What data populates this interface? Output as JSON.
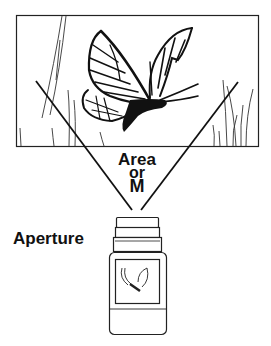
{
  "diagram": {
    "labels": {
      "area": "Area",
      "or": "or",
      "m": "M",
      "aperture": "Aperture"
    },
    "elements": [
      {
        "id": "scene-frame",
        "description": "Rectangular scene frame with butterfly and grass"
      },
      {
        "id": "butterfly",
        "description": "Butterfly in flight"
      },
      {
        "id": "view-cone",
        "description": "Two converging lines from frame to camera lens"
      },
      {
        "id": "camera",
        "description": "Camera/bottle-shaped device with small butterfly image on screen"
      }
    ],
    "colors": {
      "ink": "#111111",
      "background": "#ffffff"
    }
  }
}
